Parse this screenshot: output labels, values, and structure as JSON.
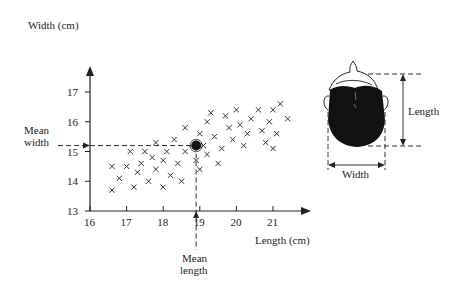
{
  "chart_data": {
    "type": "scatter",
    "title": "",
    "xlabel": "Length (cm)",
    "ylabel": "Width (cm)",
    "xlim": [
      16,
      22
    ],
    "ylim": [
      13,
      17.5
    ],
    "x_ticks": [
      "16",
      "17",
      "18",
      "19",
      "20",
      "21"
    ],
    "y_ticks": [
      "13",
      "14",
      "15",
      "16",
      "17"
    ],
    "grid": false,
    "marker": "x",
    "points": [
      [
        16.6,
        14.5
      ],
      [
        16.6,
        13.7
      ],
      [
        16.8,
        14.1
      ],
      [
        17.0,
        14.5
      ],
      [
        17.1,
        15.0
      ],
      [
        17.2,
        13.8
      ],
      [
        17.3,
        14.3
      ],
      [
        17.4,
        14.6
      ],
      [
        17.5,
        15.0
      ],
      [
        17.6,
        14.0
      ],
      [
        17.7,
        14.8
      ],
      [
        17.8,
        15.3
      ],
      [
        17.8,
        14.4
      ],
      [
        18.0,
        14.7
      ],
      [
        18.0,
        13.8
      ],
      [
        18.1,
        15.0
      ],
      [
        18.2,
        14.2
      ],
      [
        18.3,
        15.4
      ],
      [
        18.4,
        14.6
      ],
      [
        18.5,
        14.0
      ],
      [
        18.6,
        15.0
      ],
      [
        18.6,
        15.8
      ],
      [
        18.9,
        14.7
      ],
      [
        19.0,
        15.6
      ],
      [
        19.0,
        14.4
      ],
      [
        19.1,
        15.2
      ],
      [
        19.2,
        16.0
      ],
      [
        19.2,
        14.9
      ],
      [
        19.3,
        16.3
      ],
      [
        19.4,
        15.5
      ],
      [
        19.5,
        14.6
      ],
      [
        19.6,
        15.1
      ],
      [
        19.7,
        16.2
      ],
      [
        19.8,
        15.8
      ],
      [
        19.9,
        15.4
      ],
      [
        20.0,
        16.4
      ],
      [
        20.1,
        15.9
      ],
      [
        20.2,
        15.2
      ],
      [
        20.3,
        15.6
      ],
      [
        20.4,
        16.1
      ],
      [
        20.6,
        16.4
      ],
      [
        20.7,
        15.7
      ],
      [
        20.8,
        15.3
      ],
      [
        20.9,
        16.0
      ],
      [
        21.0,
        16.4
      ],
      [
        21.1,
        15.6
      ],
      [
        21.2,
        16.6
      ],
      [
        21.4,
        16.1
      ],
      [
        21.0,
        15.1
      ]
    ],
    "mean_point": {
      "x": 18.9,
      "y": 15.2
    },
    "annotations": [
      "Mean width",
      "Mean length"
    ]
  },
  "labels": {
    "y_axis": "Width (cm)",
    "x_axis": "Length (cm)",
    "mean_width_line1": "Mean",
    "mean_width_line2": "width",
    "mean_length_line1": "Mean",
    "mean_length_line2": "length",
    "head_length": "Length",
    "head_width": "Width"
  },
  "colors": {
    "ink": "#222222",
    "dashed": "#333333",
    "head_fill": "#111111"
  }
}
